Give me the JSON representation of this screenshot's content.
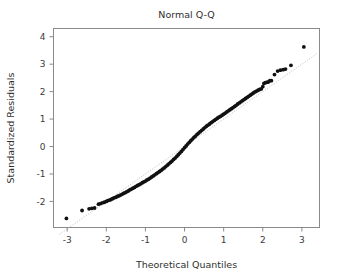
{
  "chart_data": {
    "type": "scatter",
    "title": "Normal Q-Q",
    "xlabel": "Theoretical Quantiles",
    "ylabel": "Standardized Residuals",
    "xlim": [
      -3.35,
      3.45
    ],
    "ylim": [
      -2.95,
      4.3
    ],
    "xticks": [
      -3,
      -2,
      -1,
      0,
      1,
      2,
      3
    ],
    "xticklabels": [
      "-3",
      "-2",
      "-1",
      "0",
      "1",
      "2",
      "3"
    ],
    "yticks": [
      -2,
      -1,
      0,
      1,
      2,
      3,
      4
    ],
    "yticklabels": [
      "-2",
      "-1",
      "0",
      "1",
      "2",
      "3",
      "4"
    ],
    "grid": false,
    "legend": false,
    "marker": "filled-circle",
    "marker_color": "#111111",
    "marker_size": 1.9,
    "reference_line": {
      "name": "qq-reference-line",
      "style": "dotted",
      "color": "#b9b9b9",
      "slope": 1.0,
      "intercept": 0.0,
      "x_start": -3.2,
      "x_end": 3.4
    },
    "series": [
      {
        "name": "standardized residuals",
        "points": [
          [
            -3.02,
            -2.62
          ],
          [
            -2.62,
            -2.33
          ],
          [
            -2.44,
            -2.27
          ],
          [
            -2.37,
            -2.25
          ],
          [
            -2.3,
            -2.24
          ],
          [
            -2.2,
            -2.1
          ],
          [
            -2.15,
            -2.08
          ],
          [
            -2.1,
            -2.05
          ],
          [
            -2.05,
            -2.03
          ],
          [
            -2.0,
            -2.0
          ],
          [
            -1.96,
            -1.97
          ],
          [
            -1.92,
            -1.95
          ],
          [
            -1.88,
            -1.93
          ],
          [
            -1.84,
            -1.9
          ],
          [
            -1.8,
            -1.87
          ],
          [
            -1.76,
            -1.85
          ],
          [
            -1.72,
            -1.82
          ],
          [
            -1.68,
            -1.8
          ],
          [
            -1.64,
            -1.77
          ],
          [
            -1.6,
            -1.74
          ],
          [
            -1.56,
            -1.71
          ],
          [
            -1.52,
            -1.68
          ],
          [
            -1.48,
            -1.65
          ],
          [
            -1.44,
            -1.62
          ],
          [
            -1.4,
            -1.58
          ],
          [
            -1.36,
            -1.55
          ],
          [
            -1.32,
            -1.52
          ],
          [
            -1.28,
            -1.49
          ],
          [
            -1.24,
            -1.45
          ],
          [
            -1.2,
            -1.42
          ],
          [
            -1.16,
            -1.39
          ],
          [
            -1.12,
            -1.36
          ],
          [
            -1.08,
            -1.32
          ],
          [
            -1.04,
            -1.29
          ],
          [
            -1.0,
            -1.26
          ],
          [
            -0.96,
            -1.22
          ],
          [
            -0.92,
            -1.19
          ],
          [
            -0.88,
            -1.15
          ],
          [
            -0.84,
            -1.11
          ],
          [
            -0.8,
            -1.07
          ],
          [
            -0.76,
            -1.03
          ],
          [
            -0.72,
            -0.99
          ],
          [
            -0.68,
            -0.95
          ],
          [
            -0.64,
            -0.91
          ],
          [
            -0.6,
            -0.87
          ],
          [
            -0.56,
            -0.82
          ],
          [
            -0.52,
            -0.78
          ],
          [
            -0.48,
            -0.73
          ],
          [
            -0.44,
            -0.68
          ],
          [
            -0.4,
            -0.63
          ],
          [
            -0.36,
            -0.58
          ],
          [
            -0.32,
            -0.53
          ],
          [
            -0.28,
            -0.47
          ],
          [
            -0.24,
            -0.42
          ],
          [
            -0.2,
            -0.36
          ],
          [
            -0.16,
            -0.3
          ],
          [
            -0.12,
            -0.24
          ],
          [
            -0.08,
            -0.18
          ],
          [
            -0.04,
            -0.11
          ],
          [
            0.0,
            -0.04
          ],
          [
            0.04,
            0.02
          ],
          [
            0.08,
            0.09
          ],
          [
            0.12,
            0.15
          ],
          [
            0.16,
            0.21
          ],
          [
            0.2,
            0.27
          ],
          [
            0.24,
            0.33
          ],
          [
            0.28,
            0.38
          ],
          [
            0.32,
            0.44
          ],
          [
            0.36,
            0.49
          ],
          [
            0.4,
            0.54
          ],
          [
            0.44,
            0.59
          ],
          [
            0.48,
            0.64
          ],
          [
            0.52,
            0.69
          ],
          [
            0.56,
            0.74
          ],
          [
            0.6,
            0.78
          ],
          [
            0.64,
            0.82
          ],
          [
            0.68,
            0.87
          ],
          [
            0.72,
            0.91
          ],
          [
            0.76,
            0.95
          ],
          [
            0.8,
            0.99
          ],
          [
            0.84,
            1.03
          ],
          [
            0.88,
            1.07
          ],
          [
            0.92,
            1.1
          ],
          [
            0.96,
            1.14
          ],
          [
            1.0,
            1.18
          ],
          [
            1.04,
            1.22
          ],
          [
            1.08,
            1.26
          ],
          [
            1.12,
            1.3
          ],
          [
            1.16,
            1.34
          ],
          [
            1.2,
            1.38
          ],
          [
            1.24,
            1.42
          ],
          [
            1.28,
            1.46
          ],
          [
            1.32,
            1.5
          ],
          [
            1.36,
            1.55
          ],
          [
            1.4,
            1.59
          ],
          [
            1.44,
            1.63
          ],
          [
            1.48,
            1.67
          ],
          [
            1.52,
            1.71
          ],
          [
            1.56,
            1.75
          ],
          [
            1.6,
            1.79
          ],
          [
            1.64,
            1.83
          ],
          [
            1.68,
            1.87
          ],
          [
            1.72,
            1.91
          ],
          [
            1.76,
            1.95
          ],
          [
            1.8,
            1.99
          ],
          [
            1.84,
            2.02
          ],
          [
            1.88,
            2.05
          ],
          [
            1.92,
            2.08
          ],
          [
            1.96,
            2.1
          ],
          [
            2.0,
            2.18
          ],
          [
            2.03,
            2.3
          ],
          [
            2.07,
            2.33
          ],
          [
            2.1,
            2.34
          ],
          [
            2.14,
            2.35
          ],
          [
            2.18,
            2.4
          ],
          [
            2.22,
            2.4
          ],
          [
            2.3,
            2.62
          ],
          [
            2.38,
            2.75
          ],
          [
            2.45,
            2.78
          ],
          [
            2.52,
            2.8
          ],
          [
            2.58,
            2.82
          ],
          [
            2.72,
            2.96
          ],
          [
            3.05,
            3.63
          ]
        ]
      }
    ]
  }
}
